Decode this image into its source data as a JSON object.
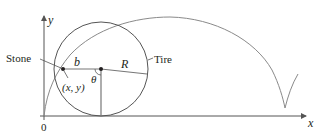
{
  "diagram": {
    "axes": {
      "x_label": "x",
      "y_label": "y",
      "origin_label": "0"
    },
    "labels": {
      "stone": "Stone",
      "tire": "Tire",
      "b": "b",
      "R": "R",
      "theta": "θ",
      "point": "(x, y)"
    },
    "colors": {
      "curve": "#8a8a8a",
      "axis": "#555555",
      "text": "#231f20"
    }
  }
}
